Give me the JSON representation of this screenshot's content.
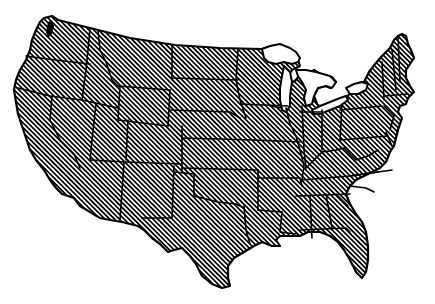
{
  "map": {
    "title": "Contiguous United States",
    "style": "hatched state outline map",
    "colors": {
      "background": "#ffffff",
      "stroke": "#000000",
      "hatch_line": "#000000",
      "hatch_gap": "#ffffff",
      "lakes": "#ffffff"
    },
    "features": {
      "land": "United States (lower 48)",
      "lakes": [
        "Lake Superior",
        "Lake Michigan",
        "Lake Huron",
        "Lake Erie",
        "Lake Ontario"
      ],
      "sound": "Puget Sound"
    }
  }
}
